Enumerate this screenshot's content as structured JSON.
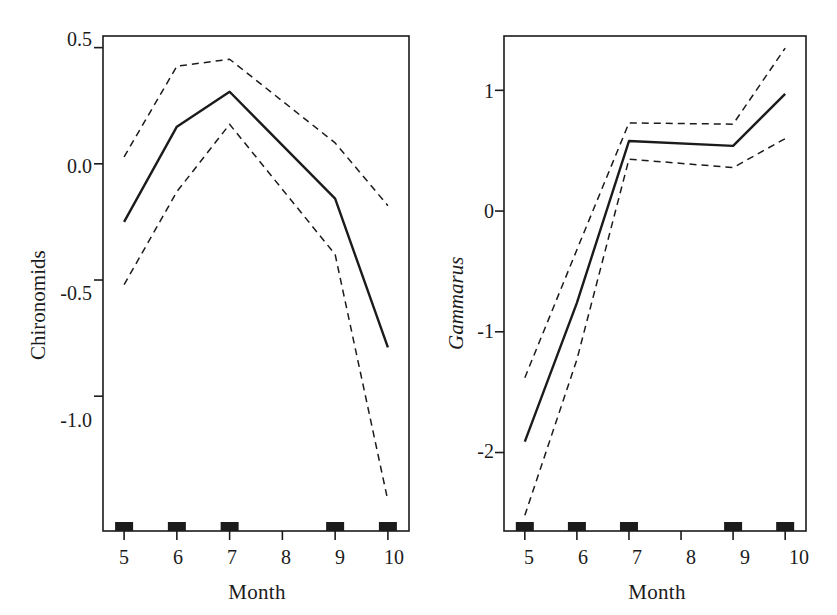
{
  "figure": {
    "background_color": "#ffffff",
    "line_color": "#1b1b1b",
    "panels": [
      {
        "id": "chironomids",
        "y_axis_label": "Chironomids",
        "y_axis_label_style": "normal",
        "x_axis_label": "Month",
        "y_ticks": [
          "0.5",
          "0.0",
          "-0.5",
          "-1.0"
        ],
        "y_tick_values": [
          0.5,
          0.0,
          -0.5,
          -1.0
        ],
        "x_ticks": [
          "5",
          "6",
          "7",
          "8",
          "9",
          "10"
        ],
        "x_tick_values": [
          5,
          6,
          7,
          8,
          9,
          10
        ]
      },
      {
        "id": "gammarus",
        "y_axis_label": "Gammarus",
        "y_axis_label_style": "italic",
        "x_axis_label": "Month",
        "y_ticks": [
          "1",
          "0",
          "-1",
          "-2"
        ],
        "y_tick_values": [
          1,
          0,
          -1,
          -2
        ],
        "x_ticks": [
          "5",
          "6",
          "7",
          "8",
          "9",
          "10"
        ],
        "x_tick_values": [
          5,
          6,
          7,
          8,
          9,
          10
        ]
      }
    ]
  },
  "chart_data": [
    {
      "type": "line",
      "title": "",
      "panel": "left",
      "xlabel": "Month",
      "ylabel": "Chironomids",
      "x": [
        5,
        6,
        7,
        9,
        10
      ],
      "xlim": [
        4.6,
        10.4
      ],
      "ylim": [
        -1.58,
        0.55
      ],
      "grid": false,
      "legend": "none",
      "rug_marks": [
        5,
        6,
        7,
        9,
        10
      ],
      "series": [
        {
          "name": "fitted smoother",
          "style": "solid",
          "values": [
            -0.25,
            0.16,
            0.31,
            -0.15,
            -0.79
          ]
        },
        {
          "name": "upper confidence band",
          "style": "dashed",
          "values": [
            0.03,
            0.42,
            0.45,
            0.09,
            -0.18
          ]
        },
        {
          "name": "lower confidence band",
          "style": "dashed",
          "values": [
            -0.52,
            -0.12,
            0.17,
            -0.39,
            -1.45
          ]
        }
      ]
    },
    {
      "type": "line",
      "title": "",
      "panel": "right",
      "xlabel": "Month",
      "ylabel": "Gammarus",
      "x": [
        5,
        6,
        7,
        9,
        10
      ],
      "xlim": [
        4.6,
        10.4
      ],
      "ylim": [
        -2.65,
        1.45
      ],
      "grid": false,
      "legend": "none",
      "rug_marks": [
        5,
        6,
        7,
        9,
        10
      ],
      "series": [
        {
          "name": "fitted smoother",
          "style": "solid",
          "values": [
            -1.91,
            -0.76,
            0.58,
            0.54,
            0.97
          ]
        },
        {
          "name": "upper confidence band",
          "style": "dashed",
          "values": [
            -1.38,
            -0.32,
            0.73,
            0.72,
            1.35
          ]
        },
        {
          "name": "lower confidence band",
          "style": "dashed",
          "values": [
            -2.52,
            -1.23,
            0.43,
            0.36,
            0.6
          ]
        }
      ]
    }
  ]
}
